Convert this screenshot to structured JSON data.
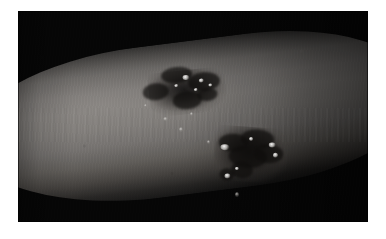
{
  "page": {
    "background_color": "#ffffff",
    "width": 386,
    "height": 239
  },
  "photo": {
    "name": "clinical-photograph",
    "caption": "",
    "subject": "human arm",
    "frame": {
      "left": 18,
      "top": 11,
      "width": 350,
      "height": 211,
      "background_color": "#060606"
    },
    "colors": {
      "backdrop": "#060606",
      "skin_highlight": "#817e7b",
      "skin_midtone": "#6e6b69",
      "skin_shadow": "#35322f",
      "lesion": "#161413",
      "vesicle_highlight": "#ffffff"
    },
    "anatomy": {
      "region_label": "arm",
      "orientation": "limb runs left to right, tilted upward toward the right",
      "lighting": "frontal flash, specular sheen across the upper limb surface"
    },
    "findings": [
      {
        "id": "lesion-upper",
        "label": "upper plaque",
        "description": "dark irregular eczematous plaque with scattered vesicles",
        "position": "upper middle of limb"
      },
      {
        "id": "lesion-lower",
        "label": "lower plaque",
        "description": "dark irregular plaque with bright vesicles and excoriation",
        "position": "lower right of limb"
      }
    ]
  }
}
